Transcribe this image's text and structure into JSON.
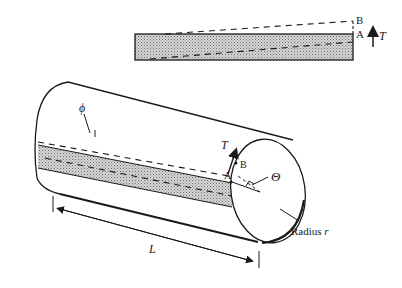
{
  "diagram": {
    "inset": {
      "point_b": "B",
      "point_a": "A",
      "torque_label": "T"
    },
    "cylinder": {
      "twist_angle_label": "ϕ",
      "torque_label": "T",
      "point_a": "A",
      "point_b": "B",
      "rotation_angle_label": "Θ",
      "radius_label": "Radius r",
      "radius_label_prefix": "Radius",
      "radius_symbol": "r",
      "length_label": "L"
    },
    "colors": {
      "line": "#1a1a1a",
      "shading": "#bfbfbf",
      "background": "#ffffff"
    }
  }
}
